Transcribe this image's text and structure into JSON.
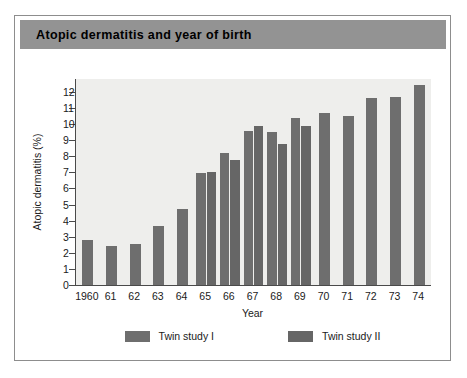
{
  "figure": {
    "title": "Atopic dermatitis and year of birth"
  },
  "chart_data": {
    "type": "bar",
    "title": "Atopic dermatitis and year of birth",
    "xlabel": "Year",
    "ylabel": "Atopic dermatitis (%)",
    "ylim": [
      0,
      12.8
    ],
    "yticks": [
      0,
      1,
      2,
      3,
      4,
      5,
      6,
      7,
      8,
      9,
      10,
      11,
      12
    ],
    "ytick_labels": [
      "0",
      "1",
      "2",
      "3",
      "4",
      "5",
      "6",
      "7",
      "8",
      "9",
      "10",
      "11",
      "12"
    ],
    "grid": false,
    "legend_position": "bottom",
    "categories": [
      "1960",
      "61",
      "62",
      "63",
      "64",
      "65",
      "66",
      "67",
      "68",
      "69",
      "70",
      "71",
      "72",
      "73",
      "74"
    ],
    "series": [
      {
        "name": "Twin study I",
        "color": "#6e6e6e",
        "values": [
          2.8,
          2.45,
          2.55,
          3.65,
          4.7,
          6.95,
          8.2,
          9.6,
          9.5,
          10.35,
          10.7,
          10.5,
          11.65,
          11.7,
          12.4
        ]
      },
      {
        "name": "Twin study II",
        "color": "#666666",
        "values": [
          null,
          null,
          null,
          null,
          null,
          7.05,
          7.75,
          9.85,
          8.75,
          9.85,
          null,
          null,
          null,
          null,
          null
        ]
      }
    ]
  },
  "legend": {
    "items": [
      {
        "label": "Twin study I",
        "color": "#6e6e6e"
      },
      {
        "label": "Twin study II",
        "color": "#666666"
      }
    ]
  }
}
